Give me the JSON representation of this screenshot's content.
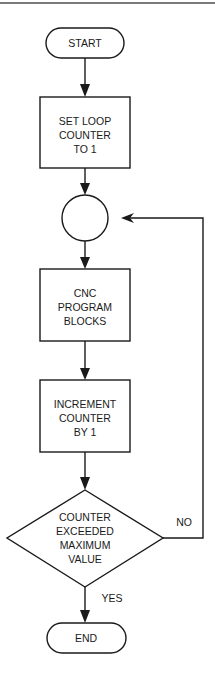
{
  "diagram": {
    "type": "flowchart",
    "nodes": {
      "start": {
        "shape": "terminal",
        "label": "START"
      },
      "set_counter": {
        "shape": "process",
        "lines": [
          "SET LOOP",
          "COUNTER",
          "TO 1"
        ]
      },
      "connector": {
        "shape": "connector",
        "label": ""
      },
      "program_blocks": {
        "shape": "process",
        "lines": [
          "CNC",
          "PROGRAM",
          "BLOCKS"
        ]
      },
      "increment": {
        "shape": "process",
        "lines": [
          "INCREMENT",
          "COUNTER",
          "BY 1"
        ]
      },
      "decision": {
        "shape": "decision",
        "lines": [
          "COUNTER",
          "EXCEEDED",
          "MAXIMUM",
          "VALUE"
        ]
      },
      "end": {
        "shape": "terminal",
        "label": "END"
      }
    },
    "edges": {
      "no_label": "NO",
      "yes_label": "YES"
    },
    "colors": {
      "stroke": "#1a1a1a",
      "background": "#ffffff",
      "top_rule": "#7a7a7a"
    }
  }
}
